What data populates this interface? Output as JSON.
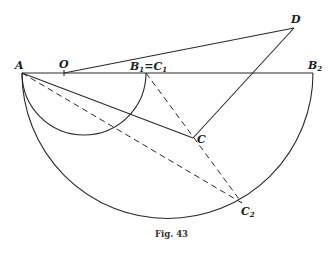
{
  "figure": {
    "caption": "Fig. 43",
    "points": {
      "A": {
        "label": "A",
        "x": 22,
        "y": 73
      },
      "O": {
        "label": "O",
        "x": 64,
        "y": 73
      },
      "B1C1": {
        "label": "B",
        "sub1": "1",
        "eq": "=C",
        "sub2": "1",
        "x": 146,
        "y": 73
      },
      "B2": {
        "label": "B",
        "sub": "2",
        "x": 313,
        "y": 73
      },
      "C": {
        "label": "C",
        "x": 193,
        "y": 138
      },
      "C2": {
        "label": "C",
        "sub": "2",
        "x": 242,
        "y": 203
      },
      "D": {
        "label": "D",
        "x": 294,
        "y": 28
      }
    },
    "stroke_color": "#2a2a2a",
    "background": "#ffffff"
  }
}
